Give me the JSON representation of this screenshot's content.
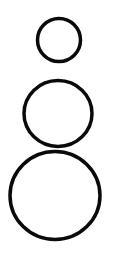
{
  "diagram": {
    "background": "#ffffff",
    "stroke_color": "#0a0a0a",
    "stroke_width": 3.5,
    "shapes": [
      {
        "id": "circle-small",
        "type": "ellipse",
        "cx": 59,
        "cy": 40,
        "rx": 21.5,
        "ry": 21.5
      },
      {
        "id": "circle-medium",
        "type": "ellipse",
        "cx": 58,
        "cy": 113.5,
        "rx": 34,
        "ry": 33
      },
      {
        "id": "circle-large",
        "type": "ellipse",
        "cx": 55,
        "cy": 195.5,
        "rx": 45,
        "ry": 44
      }
    ]
  }
}
